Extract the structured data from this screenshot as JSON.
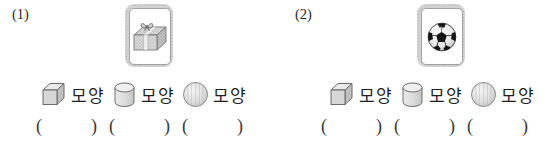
{
  "problems": [
    {
      "number": "(1)",
      "card_object": "gift-box",
      "options": [
        {
          "icon": "cube-icon",
          "label": "모양"
        },
        {
          "icon": "cylinder-icon",
          "label": "모양"
        },
        {
          "icon": "sphere-icon",
          "label": "모양"
        }
      ],
      "answers": [
        {
          "open": "(",
          "close": ")",
          "value": ""
        },
        {
          "open": "(",
          "close": ")",
          "value": ""
        },
        {
          "open": "(",
          "close": ")",
          "value": ""
        }
      ]
    },
    {
      "number": "(2)",
      "card_object": "soccer-ball",
      "options": [
        {
          "icon": "cube-icon",
          "label": "모양"
        },
        {
          "icon": "cylinder-icon",
          "label": "모양"
        },
        {
          "icon": "sphere-icon",
          "label": "모양"
        }
      ],
      "answers": [
        {
          "open": "(",
          "close": ")",
          "value": ""
        },
        {
          "open": "(",
          "close": ")",
          "value": ""
        },
        {
          "open": "(",
          "close": ")",
          "value": ""
        }
      ]
    }
  ],
  "colors": {
    "background": "#ffffff",
    "text": "#1f1f1f",
    "card_frame": "#d2d2d2",
    "card_inner_border": "#a3a3a3",
    "shape_fill": "#d7d7d7",
    "shape_stroke": "#6b6b6b",
    "ball_black": "#141414"
  }
}
